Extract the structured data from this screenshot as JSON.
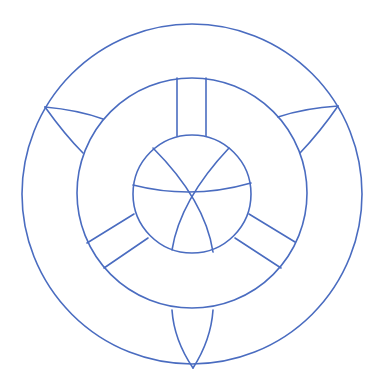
{
  "diagram": {
    "title": "",
    "stroke_color": "#4a6cc0",
    "background": "#ffffff",
    "circles": {
      "outer": {
        "cx": 192,
        "cy": 194,
        "r": 170
      },
      "middle": {
        "cx": 192,
        "cy": 193,
        "r": 115
      },
      "inner": {
        "cx": 192,
        "cy": 194,
        "r": 59
      }
    },
    "inner_arcs": [
      {
        "name": "horizontal-arc",
        "d": "M133,185 Q192,200 251,183"
      },
      {
        "name": "left-to-bottom-right-arc",
        "d": "M153,148 Q205,200 213,252"
      },
      {
        "name": "right-to-bottom-left-arc",
        "d": "M229,148 Q180,200 172,250"
      }
    ],
    "spokes": [
      {
        "name": "top-spoke",
        "lines": [
          "M177,78 L177,136",
          "M206,78 L206,136"
        ]
      },
      {
        "name": "lower-left-spoke",
        "lines": [
          "M87,243 L134,214",
          "M104,268 L148,238"
        ]
      },
      {
        "name": "lower-right-spoke",
        "lines": [
          "M249,214 L295,242",
          "M235,238 L281,268"
        ]
      }
    ],
    "leaves": [
      {
        "name": "upper-left-leaf",
        "paths": [
          "M45,107 Q78,110 103,119",
          "M45,107 Q65,135 83,153"
        ]
      },
      {
        "name": "upper-right-leaf",
        "paths": [
          "M338,106 Q305,108 278,117",
          "M338,106 Q320,132 300,153"
        ]
      },
      {
        "name": "bottom-leaf",
        "paths": [
          "M193,368 Q174,340 172,310",
          "M193,368 Q211,340 213,310"
        ]
      }
    ]
  }
}
